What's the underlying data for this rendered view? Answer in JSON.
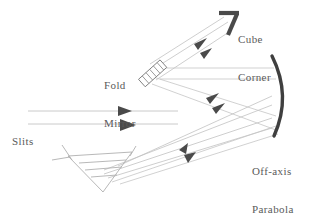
{
  "figure": {
    "background_color": "#ffffff",
    "ray_color": "#b9b9b9",
    "arrow_color": "#4a4a4a",
    "optic_color": "#707070",
    "heavy_optic_color": "#3c3c3c",
    "text_color": "#5a5a5a"
  },
  "labels": {
    "cube_corner": {
      "line1": "Cube",
      "line2": "Corner",
      "icon": "cube-corner-retroreflector-icon"
    },
    "fold_mirror": {
      "line1": "Fold",
      "line2": "Mirror",
      "icon": "fold-mirror-icon"
    },
    "slits": {
      "line1": "Slits",
      "icon": "slits-icon"
    },
    "off_axis_parabola": {
      "line1": "Off-axis",
      "line2": "Parabola",
      "icon": "parabola-mirror-icon"
    },
    "prism": {
      "line1": "Prism",
      "icon": "prism-icon"
    }
  },
  "components": [
    {
      "id": "slits",
      "name": "Slits",
      "kind": "source"
    },
    {
      "id": "prism",
      "name": "Prism",
      "kind": "dispersive-element"
    },
    {
      "id": "off-axis-parabola",
      "name": "Off-axis Parabola",
      "kind": "curved-mirror"
    },
    {
      "id": "fold-mirror",
      "name": "Fold Mirror",
      "kind": "flat-mirror"
    },
    {
      "id": "cube-corner",
      "name": "Cube Corner",
      "kind": "retroreflector"
    }
  ],
  "beam_paths": [
    {
      "id": "slits-to-prism",
      "from": "Slits",
      "to": "Prism",
      "direction": "right"
    },
    {
      "id": "prism-to-parabola",
      "from": "Prism",
      "to": "Off-axis Parabola",
      "direction": "up-right"
    },
    {
      "id": "parabola-to-fold-mirror",
      "from": "Off-axis Parabola",
      "to": "Fold Mirror",
      "direction": "left"
    },
    {
      "id": "fold-mirror-to-cube-corner",
      "from": "Fold Mirror",
      "to": "Cube Corner",
      "direction": "up-right"
    },
    {
      "id": "parabola-to-prism",
      "from": "Off-axis Parabola",
      "to": "Prism",
      "direction": "down-left"
    }
  ]
}
